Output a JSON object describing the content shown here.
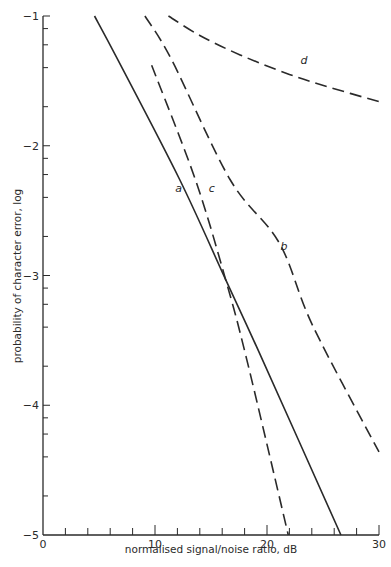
{
  "chart_data": {
    "type": "line",
    "title": "",
    "xlabel": "normalised signal/noise ratio, dB",
    "ylabel": "probability of character error, log",
    "xlim": [
      0,
      30
    ],
    "ylim": [
      -5,
      -1
    ],
    "x_ticks": [
      0,
      10,
      20,
      30
    ],
    "x_tick_labels": [
      "0",
      "10",
      "20",
      "30"
    ],
    "x_minor_step": 2,
    "y_ticks": [
      -1,
      -2,
      -3,
      -4,
      -5
    ],
    "y_tick_labels": [
      "-1",
      "-2",
      "-3",
      "-4",
      "-5"
    ],
    "y_minor_fractions": [
      0.097,
      0.222,
      0.398,
      0.699
    ],
    "grid": false,
    "legend": "none (curves labelled inline)",
    "series": [
      {
        "name": "a",
        "style": "solid",
        "x": [
          4.6,
          6.7,
          12.2,
          16.3,
          19.6,
          26.6
        ],
        "y": [
          -1.0,
          -1.34,
          -2.26,
          -3.03,
          -3.65,
          -5.0
        ],
        "label_pos": [
          11.8,
          -2.36
        ]
      },
      {
        "name": "b",
        "style": "dashed",
        "x": [
          9.1,
          11.5,
          16.7,
          21.1,
          24.1,
          30.0
        ],
        "y": [
          -1.0,
          -1.34,
          -2.26,
          -2.75,
          -3.39,
          -4.36
        ],
        "label_pos": [
          21.2,
          -2.8
        ]
      },
      {
        "name": "c",
        "style": "dashed",
        "x": [
          9.7,
          13.6,
          16.3,
          18.2,
          21.9
        ],
        "y": [
          -1.38,
          -2.26,
          -3.03,
          -3.65,
          -5.0
        ],
        "label_pos": [
          14.8,
          -2.36
        ]
      },
      {
        "name": "d",
        "style": "dashed",
        "x": [
          11.2,
          14.0,
          17.6,
          22.0,
          25.6,
          30.0
        ],
        "y": [
          -1.0,
          -1.15,
          -1.3,
          -1.45,
          -1.55,
          -1.66
        ],
        "label_pos": [
          23.0,
          -1.37
        ]
      }
    ]
  }
}
